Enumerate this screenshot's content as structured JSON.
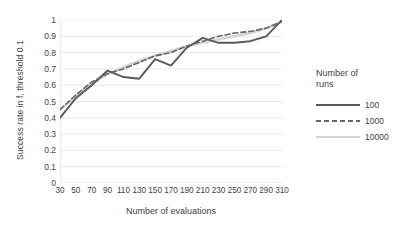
{
  "chart_data": {
    "type": "line",
    "title": "",
    "xlabel": "Number of evaluations",
    "ylabel": "Success rate in f, threshold 0.1",
    "xlim": [
      30,
      310
    ],
    "ylim": [
      0,
      1
    ],
    "grid": true,
    "legend_position": "right",
    "legend_title": "Number of runs",
    "x": [
      30,
      50,
      70,
      90,
      110,
      130,
      150,
      170,
      190,
      210,
      230,
      250,
      270,
      290,
      310
    ],
    "xticklabels": [
      "30",
      "50",
      "70",
      "90",
      "110",
      "130",
      "150",
      "170",
      "190",
      "210",
      "230",
      "250",
      "270",
      "290",
      "310"
    ],
    "yticklabels": [
      "0",
      "0.1",
      "0.2",
      "0.3",
      "0.4",
      "0.5",
      "0.6",
      "0.7",
      "0.8",
      "0.9",
      "1"
    ],
    "yticks": [
      0,
      0.1,
      0.2,
      0.3,
      0.4,
      0.5,
      0.6,
      0.7,
      0.8,
      0.9,
      1
    ],
    "series": [
      {
        "name": "100",
        "style": "solid",
        "color": "#595959",
        "width": 1.9,
        "values": [
          0.4,
          0.52,
          0.6,
          0.69,
          0.65,
          0.64,
          0.76,
          0.72,
          0.83,
          0.89,
          0.86,
          0.86,
          0.87,
          0.9,
          1.0
        ]
      },
      {
        "name": "1000",
        "style": "dashed",
        "color": "#666666",
        "width": 1.6,
        "values": [
          0.45,
          0.54,
          0.62,
          0.67,
          0.7,
          0.74,
          0.78,
          0.8,
          0.84,
          0.87,
          0.9,
          0.92,
          0.93,
          0.95,
          0.99
        ]
      },
      {
        "name": "10000",
        "style": "solid",
        "color": "#d4d4d4",
        "width": 2.6,
        "values": [
          0.45,
          0.53,
          0.61,
          0.67,
          0.71,
          0.75,
          0.78,
          0.81,
          0.84,
          0.86,
          0.88,
          0.9,
          0.92,
          0.95,
          0.99
        ]
      }
    ]
  },
  "colors": {
    "grid": "#e8e8e8",
    "axis": "#d9d9d9",
    "text": "#3f3f3f",
    "background": "#ffffff"
  }
}
